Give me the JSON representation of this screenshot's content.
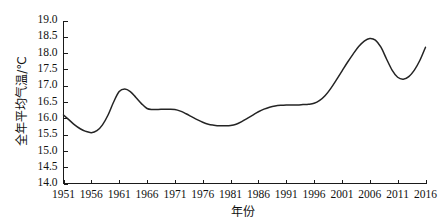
{
  "chart_data": {
    "type": "line",
    "title": "",
    "xlabel": "年份",
    "ylabel": "全年平均气温/℃",
    "xlim": [
      1951,
      2016
    ],
    "ylim": [
      14.0,
      19.0
    ],
    "grid": false,
    "legend": null,
    "x_tick_labels": [
      "1951",
      "1956",
      "1961",
      "1966",
      "1971",
      "1976",
      "1981",
      "1986",
      "1991",
      "1996",
      "2001",
      "2006",
      "2011",
      "2016"
    ],
    "y_tick_labels": [
      "14.0",
      "14.5",
      "15.0",
      "15.5",
      "16.0",
      "16.5",
      "17.0",
      "17.5",
      "18.0",
      "18.5",
      "19.0"
    ],
    "x_ticks": [
      1951,
      1956,
      1961,
      1966,
      1971,
      1976,
      1981,
      1986,
      1991,
      1996,
      2001,
      2006,
      2011,
      2016
    ],
    "y_ticks": [
      14.0,
      14.5,
      15.0,
      15.5,
      16.0,
      16.5,
      17.0,
      17.5,
      18.0,
      18.5,
      19.0
    ],
    "line_color": "#242424",
    "series": [
      {
        "name": "全年平均气温",
        "x": [
          1951,
          1952,
          1953,
          1954,
          1955,
          1956,
          1957,
          1958,
          1959,
          1960,
          1961,
          1962,
          1963,
          1964,
          1965,
          1966,
          1967,
          1968,
          1969,
          1970,
          1971,
          1972,
          1973,
          1974,
          1975,
          1976,
          1977,
          1978,
          1979,
          1980,
          1981,
          1982,
          1983,
          1984,
          1985,
          1986,
          1987,
          1988,
          1989,
          1990,
          1991,
          1992,
          1993,
          1994,
          1995,
          1996,
          1997,
          1998,
          1999,
          2000,
          2001,
          2002,
          2003,
          2004,
          2005,
          2006,
          2007,
          2008,
          2009,
          2010,
          2011,
          2012,
          2013,
          2014,
          2015,
          2016
        ],
        "values": [
          16.1,
          15.95,
          15.8,
          15.68,
          15.6,
          15.56,
          15.62,
          15.8,
          16.1,
          16.5,
          16.82,
          16.9,
          16.82,
          16.64,
          16.45,
          16.3,
          16.27,
          16.27,
          16.28,
          16.28,
          16.27,
          16.22,
          16.14,
          16.05,
          15.96,
          15.88,
          15.82,
          15.79,
          15.77,
          15.77,
          15.78,
          15.82,
          15.9,
          16.0,
          16.1,
          16.2,
          16.28,
          16.34,
          16.38,
          16.4,
          16.41,
          16.41,
          16.41,
          16.42,
          16.43,
          16.46,
          16.55,
          16.7,
          16.92,
          17.18,
          17.45,
          17.72,
          17.97,
          18.2,
          18.37,
          18.45,
          18.4,
          18.18,
          17.82,
          17.48,
          17.26,
          17.2,
          17.28,
          17.48,
          17.78,
          18.18
        ]
      }
    ]
  }
}
